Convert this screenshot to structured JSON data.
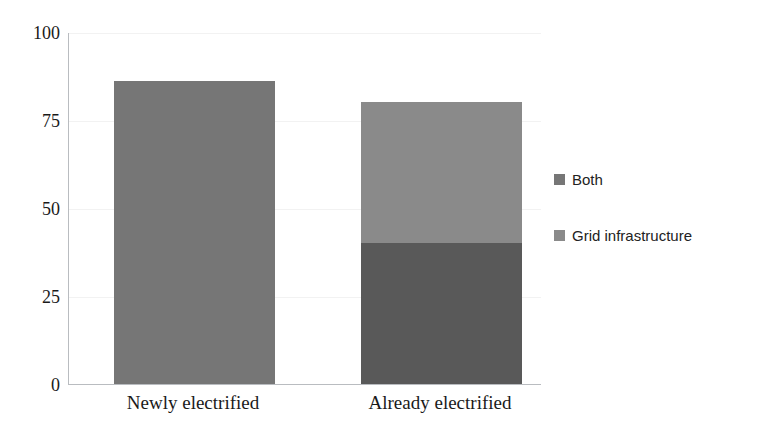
{
  "chart_data": {
    "type": "bar",
    "subtype": "stacked-bar",
    "title": "",
    "xlabel": "",
    "ylabel": "",
    "categories": [
      "Newly electrified",
      "Already electrified"
    ],
    "series": [
      {
        "name": "Both",
        "values": [
          0,
          40
        ],
        "color": "#595959"
      },
      {
        "name": "Grid infrastructure",
        "values": [
          86,
          40
        ],
        "color": "#767676"
      }
    ],
    "stack_totals": [
      86,
      80
    ],
    "ylim": [
      0,
      100
    ],
    "yticks": [
      0,
      25,
      50,
      75,
      100
    ],
    "ytick_labels": [
      "0",
      "25",
      "50",
      "75",
      "100"
    ],
    "grid": true,
    "grid_color": "#f2f2f2",
    "axis_color": "#b9bcc0",
    "legend_position": "right",
    "legend": [
      {
        "label": "Both",
        "color": "#767676"
      },
      {
        "label": "Grid infrastructure",
        "color": "#8a8a8a"
      }
    ],
    "background": "#ffffff"
  },
  "bars": [
    {
      "category": "Newly electrified",
      "left_px": 45,
      "width_px": 161,
      "segments": [
        {
          "name": "Grid infrastructure",
          "value": 86,
          "color": "#767676"
        }
      ]
    },
    {
      "category": "Already electrified",
      "left_px": 292,
      "width_px": 161,
      "segments": [
        {
          "name": "Both",
          "value": 40,
          "color": "#595959"
        },
        {
          "name": "Grid infrastructure",
          "value": 40,
          "color": "#8a8a8a"
        }
      ]
    }
  ]
}
